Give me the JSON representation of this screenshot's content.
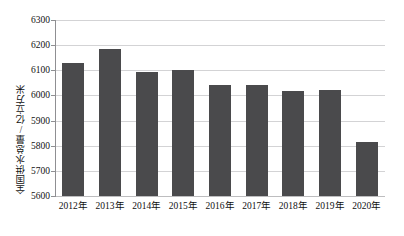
{
  "chart_data": {
    "type": "bar",
    "title": "",
    "xlabel": "",
    "ylabel": "全国供水总量/亿立方米",
    "categories": [
      "2012年",
      "2013年",
      "2014年",
      "2015年",
      "2016年",
      "2017年",
      "2018年",
      "2019年",
      "2020年"
    ],
    "values": [
      6128,
      6183,
      6095,
      6103,
      6040,
      6043,
      6016,
      6021,
      5813
    ],
    "ylim": [
      5600,
      6300
    ],
    "yticks": [
      5600,
      5700,
      5800,
      5900,
      6000,
      6100,
      6200,
      6300
    ],
    "ytick_labels": [
      "5600",
      "5700",
      "5800",
      "5900",
      "6000",
      "6100",
      "6200",
      "6300"
    ],
    "grid": true,
    "legend": false,
    "legend_position": "none",
    "series": [
      {
        "name": "全国供水总量",
        "color": "#4a4a4c",
        "values": [
          6128,
          6183,
          6095,
          6103,
          6040,
          6043,
          6016,
          6021,
          5813
        ]
      }
    ]
  },
  "axis": {
    "y_title": "全国供水总量/亿立方米",
    "y_labels": [
      "6300",
      "6200",
      "6100",
      "6000",
      "5900",
      "5800",
      "5700",
      "5600"
    ],
    "x_labels": [
      "2012年",
      "2013年",
      "2014年",
      "2015年",
      "2016年",
      "2017年",
      "2018年",
      "2019年",
      "2020年"
    ]
  },
  "style": {
    "bar_color": "#4a4a4c",
    "grid_color": "#d3d3d5",
    "axis_color": "#8f8f92",
    "background": "#ffffff",
    "text_color": "#111111"
  },
  "top_strip": {
    "text": " "
  }
}
